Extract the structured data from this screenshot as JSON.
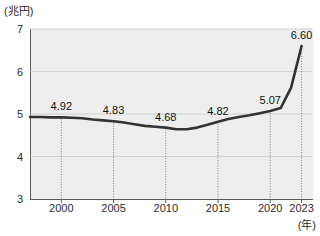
{
  "chart_data": {
    "type": "line",
    "title": "",
    "subtitle": "",
    "xlabel": "(年)",
    "ylabel": "(兆円)",
    "xlim": [
      1997,
      2024
    ],
    "ylim": [
      3,
      7
    ],
    "grid": true,
    "legend": false,
    "line_color": "#333333",
    "plot_background": "#eeeeee",
    "axis_color": "#5a5a5a",
    "y_ticks": [
      7,
      6,
      5,
      4,
      3
    ],
    "y_tick_labels": [
      "7",
      "6",
      "5",
      "4",
      "3"
    ],
    "x_ticks": [
      2000,
      2005,
      2010,
      2015,
      2020,
      2023
    ],
    "x_tick_labels": [
      "2000",
      "2005",
      "2010",
      "2015",
      "2020",
      "2023"
    ],
    "labeled_points": [
      {
        "x": 2000,
        "y": 4.92,
        "label": "4.92"
      },
      {
        "x": 2005,
        "y": 4.83,
        "label": "4.83"
      },
      {
        "x": 2010,
        "y": 4.68,
        "label": "4.68"
      },
      {
        "x": 2015,
        "y": 4.82,
        "label": "4.82"
      },
      {
        "x": 2020,
        "y": 5.07,
        "label": "5.07"
      },
      {
        "x": 2023,
        "y": 6.6,
        "label": "6.60"
      }
    ],
    "x": [
      1997,
      1998,
      1999,
      2000,
      2001,
      2002,
      2003,
      2004,
      2005,
      2006,
      2007,
      2008,
      2009,
      2010,
      2011,
      2012,
      2013,
      2014,
      2015,
      2016,
      2017,
      2018,
      2019,
      2020,
      2021,
      2022,
      2023
    ],
    "values": [
      4.93,
      4.93,
      4.92,
      4.92,
      4.91,
      4.9,
      4.87,
      4.85,
      4.83,
      4.8,
      4.76,
      4.72,
      4.7,
      4.68,
      4.64,
      4.64,
      4.68,
      4.75,
      4.82,
      4.88,
      4.93,
      4.97,
      5.02,
      5.07,
      5.14,
      5.62,
      6.6
    ]
  }
}
